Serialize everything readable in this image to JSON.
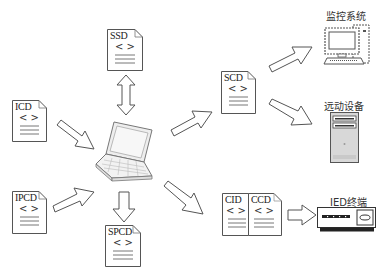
{
  "documents": {
    "ssd": {
      "label": "SSD"
    },
    "icd": {
      "label": "ICD"
    },
    "ipcd": {
      "label": "IPCD"
    },
    "spcd": {
      "label": "SPCD"
    },
    "scd": {
      "label": "SCD"
    },
    "cid": {
      "label": "CID"
    },
    "ccd": {
      "label": "CCD"
    },
    "doc_symbol": "< >"
  },
  "devices": {
    "monitoring": {
      "label": "监控系统",
      "icon": "computer-monitor-icon"
    },
    "telecontrol": {
      "label": "远动设备",
      "icon": "server-tower-icon"
    },
    "ied": {
      "label": "IED终端",
      "icon": "ied-device-icon"
    }
  },
  "center": {
    "icon": "laptop-icon"
  },
  "colors": {
    "stroke": "#555555",
    "fill": "#ffffff",
    "device_gray": "#d8d8d8"
  }
}
